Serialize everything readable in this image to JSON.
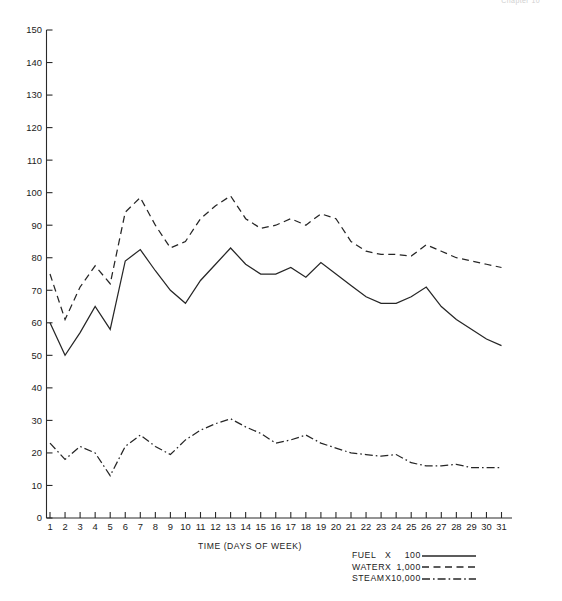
{
  "header_note": "Chapter 10",
  "axis_title": "TIME (DAYS OF WEEK)",
  "legend": {
    "rows": [
      {
        "name": "FUEL",
        "times": "X",
        "multiplier": "100",
        "style": "solid",
        "series_key": "fuel"
      },
      {
        "name": "WATER",
        "times": "X",
        "multiplier": "1,000",
        "style": "dashed",
        "series_key": "water"
      },
      {
        "name": "STEAM",
        "times": "X",
        "multiplier": "10,000",
        "style": "dash-dot",
        "series_key": "steam"
      }
    ]
  },
  "chart_data": {
    "type": "line",
    "title": "",
    "subtitle": "",
    "xlabel": "TIME (DAYS OF WEEK)",
    "ylabel": "",
    "xlim": [
      0,
      31
    ],
    "ylim": [
      0,
      150
    ],
    "grid": false,
    "legend_position": "bottom-right",
    "x": [
      1,
      2,
      3,
      4,
      5,
      6,
      7,
      8,
      9,
      10,
      11,
      12,
      13,
      14,
      15,
      16,
      17,
      18,
      19,
      20,
      21,
      22,
      23,
      24,
      25,
      26,
      27,
      28,
      29,
      30,
      31
    ],
    "xticklabels": [
      "1",
      "2",
      "3",
      "4",
      "5",
      "6",
      "7",
      "8",
      "9",
      "10",
      "11",
      "12",
      "13",
      "14",
      "15",
      "16",
      "17",
      "18",
      "19",
      "20",
      "21",
      "22",
      "23",
      "24",
      "25",
      "26",
      "27",
      "28",
      "29",
      "30",
      "31"
    ],
    "yticks": [
      0,
      10,
      20,
      30,
      40,
      50,
      60,
      70,
      80,
      90,
      100,
      110,
      120,
      130,
      140,
      150
    ],
    "yticklabels": [
      "0",
      "10",
      "20",
      "30",
      "40",
      "50",
      "60",
      "70",
      "80",
      "90",
      "100",
      "110",
      "120",
      "130",
      "140",
      "150"
    ],
    "series": [
      {
        "name": "FUEL",
        "label": "FUEL  X  100",
        "multiplier": 100,
        "style": "solid",
        "values": [
          60,
          50,
          57,
          65,
          58,
          79,
          82.5,
          76,
          70,
          66,
          73,
          78,
          83,
          78,
          75,
          75,
          77,
          74,
          78.5,
          75,
          71.5,
          68,
          66,
          66,
          68,
          71,
          65,
          61,
          58,
          55,
          53
        ]
      },
      {
        "name": "WATER",
        "label": "WATER  X  1,000",
        "multiplier": 1000,
        "style": "dashed",
        "values": [
          75,
          61,
          71,
          77.5,
          72,
          94,
          98.5,
          90,
          83,
          85,
          92,
          96,
          99,
          92,
          89,
          90,
          92,
          90,
          93.5,
          92,
          85,
          82,
          81,
          81,
          80.5,
          84,
          82,
          80,
          79,
          78,
          77
        ]
      },
      {
        "name": "STEAM",
        "label": "STEAM  X  10,000",
        "multiplier": 10000,
        "style": "dash-dot",
        "values": [
          23,
          18,
          22,
          20,
          13,
          22,
          25.5,
          22,
          19.5,
          24,
          27,
          29,
          30.5,
          28,
          26,
          23,
          24,
          25.5,
          23,
          21.5,
          20,
          19.5,
          19,
          19.5,
          17,
          16,
          16,
          16.5,
          15.5,
          15.5,
          15.5
        ]
      }
    ]
  }
}
